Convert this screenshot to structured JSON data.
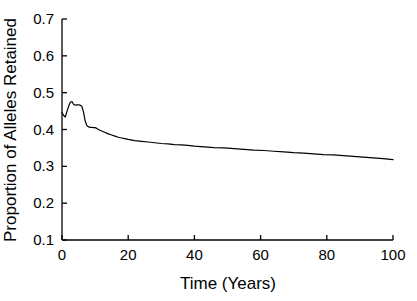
{
  "chart_data": {
    "type": "line",
    "title": "",
    "subtitle": "",
    "xlabel": "Time (Years)",
    "ylabel": "Proportion of Alleles Retained",
    "xlim": [
      0,
      100
    ],
    "ylim": [
      0.1,
      0.7
    ],
    "xticks": [
      0,
      20,
      40,
      60,
      80,
      100
    ],
    "xtick_labels": [
      "0",
      "20",
      "40",
      "60",
      "80",
      "100"
    ],
    "yticks": [
      0.1,
      0.2,
      0.3,
      0.4,
      0.5,
      0.6,
      0.7
    ],
    "ytick_labels": [
      "0.1",
      "0.2",
      "0.3",
      "0.4",
      "0.5",
      "0.6",
      "0.7"
    ],
    "grid": false,
    "legend": null,
    "legend_position": "none",
    "line_color": "#000000",
    "line_width": 1.2,
    "background_color": "#ffffff",
    "axis_color": "#000000",
    "spines": [
      "left",
      "bottom"
    ],
    "tick_direction": "in",
    "annotations": [],
    "series": [
      {
        "name": "Proportion of Alleles Retained",
        "x": [
          0,
          0.5,
          1,
          1.5,
          2,
          2.5,
          3,
          3.5,
          4,
          4.5,
          5,
          5.5,
          6,
          6.5,
          7,
          7.5,
          8,
          8.5,
          9,
          9.5,
          10,
          10.5,
          11,
          12,
          13,
          14,
          15,
          16,
          17,
          18,
          19,
          20,
          22,
          24,
          26,
          28,
          30,
          32,
          34,
          36,
          38,
          40,
          43,
          46,
          49,
          52,
          55,
          58,
          61,
          64,
          67,
          70,
          73,
          76,
          79,
          82,
          85,
          88,
          91,
          94,
          97,
          100
        ],
        "y": [
          0.446,
          0.438,
          0.434,
          0.449,
          0.463,
          0.474,
          0.476,
          0.468,
          0.466,
          0.467,
          0.467,
          0.466,
          0.463,
          0.447,
          0.423,
          0.411,
          0.407,
          0.406,
          0.406,
          0.405,
          0.405,
          0.403,
          0.4,
          0.396,
          0.392,
          0.388,
          0.385,
          0.382,
          0.379,
          0.377,
          0.375,
          0.373,
          0.37,
          0.368,
          0.366,
          0.364,
          0.362,
          0.361,
          0.359,
          0.358,
          0.357,
          0.355,
          0.353,
          0.351,
          0.35,
          0.348,
          0.346,
          0.344,
          0.343,
          0.341,
          0.339,
          0.337,
          0.336,
          0.334,
          0.332,
          0.331,
          0.329,
          0.327,
          0.325,
          0.323,
          0.321,
          0.318
        ]
      }
    ]
  },
  "geometry": {
    "plot_left": 62,
    "plot_right": 393,
    "plot_top": 19,
    "plot_bottom": 240,
    "tick_length": 5
  }
}
